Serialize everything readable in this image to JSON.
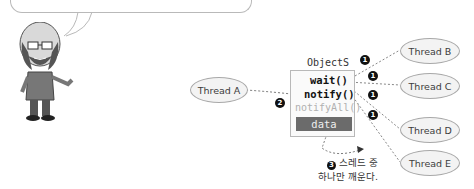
{
  "speech_bubble": {
    "text": "··· ·· ··· ·· ··· ·· ···· ·········"
  },
  "character": {
    "description": "cartoon-man-with-glasses-and-beard"
  },
  "object": {
    "title": "ObjectS",
    "methods": [
      "wait()",
      "notify()",
      "notifyAll()"
    ],
    "data_label": "data"
  },
  "threads": {
    "a": "Thread A",
    "b": "Thread B",
    "c": "Thread C",
    "d": "Thread D",
    "e": "Thread E"
  },
  "markers": {
    "one": "1",
    "two": "2",
    "three": "3"
  },
  "caption": {
    "marker": "❸",
    "line1": "스레드 중",
    "line2": "하나만 깨운다."
  },
  "colors": {
    "ellipse_fill": "#f3f3f3",
    "ellipse_border": "#a8a8a8",
    "data_bar": "#6b6b6b",
    "muted_text": "#b0b0b0",
    "marker": "#111111"
  }
}
